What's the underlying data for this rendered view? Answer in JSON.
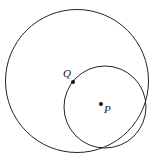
{
  "figure": {
    "type": "geometry-diagram",
    "width": 153,
    "height": 161,
    "background_color": "#ffffff",
    "stroke_color": "#252525",
    "label_color": "#161616",
    "shapes": {
      "outer_circle": {
        "name": "outer-circle",
        "cx": 77,
        "cy": 81,
        "r": 71.5,
        "stroke_width": 1
      },
      "inner_circle": {
        "name": "inner-circle",
        "cx": 105,
        "cy": 107,
        "r": 41,
        "stroke_width": 1
      }
    },
    "points": [
      {
        "id": "Q",
        "label": "Q",
        "cx": 73,
        "cy": 82,
        "r": 2,
        "label_x": 63,
        "label_y": 68,
        "on": "inner-circle"
      },
      {
        "id": "P",
        "label": "P",
        "cx": 101,
        "cy": 104,
        "r": 2,
        "label_x": 104,
        "label_y": 104,
        "on": "inner-circle-center"
      }
    ]
  }
}
